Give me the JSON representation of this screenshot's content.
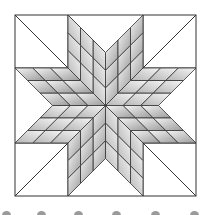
{
  "figure": {
    "name": "LeMoyne star quilt block",
    "block": {
      "x": 15,
      "y": 15,
      "size": 181
    },
    "corner_square": 53,
    "star_points": 8,
    "subdivisions": 3,
    "colors": {
      "line": "#333333",
      "background": "#ffffff",
      "diamond_light": "#f4f4f4",
      "diamond_dark": "#8e8e8e",
      "dot": "#9a9a9a"
    }
  },
  "bottom_dots": [
    2,
    37,
    74,
    112,
    151,
    190
  ]
}
